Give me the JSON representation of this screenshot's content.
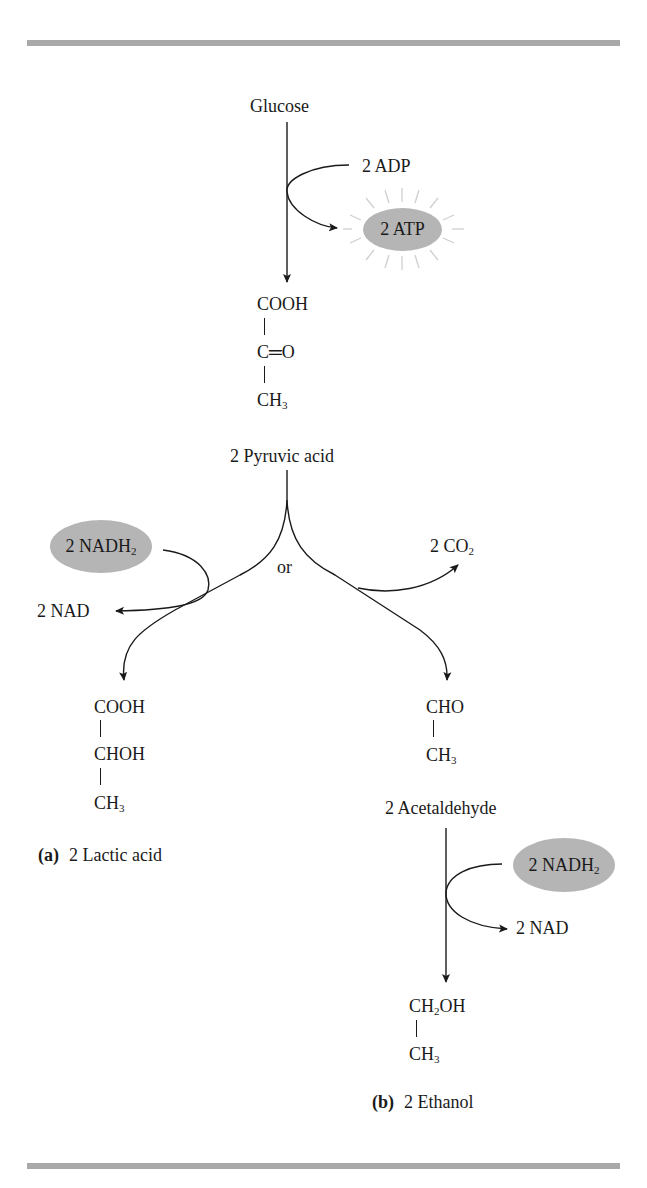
{
  "figure": {
    "start": "Glucose",
    "glycolysis": {
      "input": "2 ADP",
      "output": "2 ATP"
    },
    "pyruvate": {
      "formula": [
        "COOH",
        "C═O",
        "CH3"
      ],
      "name": "2 Pyruvic acid"
    },
    "branch_word": "or",
    "lactic_branch": {
      "cofactor_in": "2 NADH2",
      "cofactor_out": "2 NAD",
      "formula": [
        "COOH",
        "CHOH",
        "CH3"
      ],
      "caption_letter": "(a)",
      "caption_text": "2 Lactic acid"
    },
    "ethanol_branch": {
      "released": "2 CO2",
      "intermediate_formula": [
        "CHO",
        "CH3"
      ],
      "intermediate_name": "2 Acetaldehyde",
      "cofactor_in": "2 NADH2",
      "cofactor_out": "2 NAD",
      "formula": [
        "CH2OH",
        "CH3"
      ],
      "caption_letter": "(b)",
      "caption_text": "2 Ethanol"
    }
  },
  "colors": {
    "rule": "#a9a9a9",
    "highlight_oval": "#b5b5b5",
    "ink": "#1a1a1a",
    "burst": "#cfcfcf"
  }
}
